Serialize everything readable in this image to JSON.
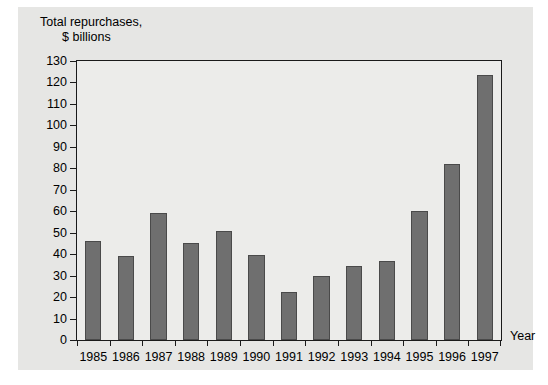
{
  "chart_data": {
    "type": "bar",
    "title": "Total repurchases, $ billions",
    "title_line1": "Total repurchases,",
    "title_line2": "$ billions",
    "xlabel": "Year",
    "ylabel": "",
    "categories": [
      "1985",
      "1986",
      "1987",
      "1988",
      "1989",
      "1990",
      "1991",
      "1992",
      "1993",
      "1994",
      "1995",
      "1996",
      "1997"
    ],
    "values": [
      46,
      39,
      59,
      45,
      51,
      39.5,
      22.5,
      30,
      34.5,
      37,
      60,
      82,
      123.5
    ],
    "ylim": [
      0,
      130
    ],
    "ytick_step": 10,
    "ytick_labels": [
      "0",
      "10",
      "20",
      "30",
      "40",
      "50",
      "60",
      "70",
      "80",
      "90",
      "100",
      "110",
      "120",
      "130"
    ],
    "grid": false,
    "legend": null,
    "colors": {
      "bar_fill": "#6f6f6f",
      "bar_edge": "#4a4a4a",
      "plot_background": "#ececea",
      "panel_background": "#e6e6e4",
      "axis": "#1a1a1a",
      "page_background": "#ffffff"
    }
  }
}
